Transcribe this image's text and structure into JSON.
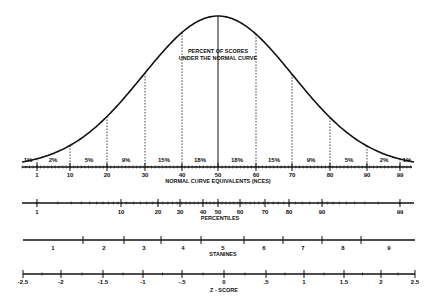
{
  "title_lines": [
    "PERCENT OF SCORES",
    "UNDER THE NORMAL CURVE"
  ],
  "colors": {
    "ink": "#111111",
    "background": "#ffffff"
  },
  "chart_data": {
    "type": "area",
    "title": "Percent of Scores Under the Normal Curve",
    "curve": "standard normal distribution",
    "segments": {
      "boundaries_nce": [
        1,
        10,
        20,
        30,
        40,
        50,
        60,
        70,
        80,
        90,
        99
      ],
      "percent_labels": [
        "1%",
        "2%",
        "5%",
        "9%",
        "15%",
        "18%",
        "18%",
        "15%",
        "9%",
        "5%",
        "2%",
        "1%"
      ]
    },
    "scales": [
      {
        "name": "Normal Curve Equivalents (NCEs)",
        "label": "NORMAL CURVE EQUIVALENTS (NCES)",
        "ticks": [
          "1",
          "10",
          "20",
          "30",
          "40",
          "50",
          "60",
          "70",
          "80",
          "90",
          "99"
        ]
      },
      {
        "name": "Percentiles",
        "label": "PERCENTILES",
        "ticks": [
          "1",
          "10",
          "20",
          "30",
          "40",
          "50",
          "60",
          "70",
          "80",
          "90",
          "99"
        ]
      },
      {
        "name": "Stanines",
        "label": "STANINES",
        "ticks": [
          "1",
          "2",
          "3",
          "4",
          "5",
          "6",
          "7",
          "8",
          "9"
        ]
      },
      {
        "name": "Z-Score",
        "label": "Z - SCORE",
        "ticks": [
          "-2.5",
          "-2",
          "-1.5",
          "-1",
          "-.5",
          "0",
          ".5",
          "1",
          "1.5",
          "2",
          "2.5"
        ]
      }
    ]
  },
  "nce": {
    "label": "NORMAL CURVE EQUIVALENTS (NCES)",
    "ticks": [
      {
        "t": "1",
        "x": 37
      },
      {
        "t": "10",
        "x": 70
      },
      {
        "t": "20",
        "x": 107
      },
      {
        "t": "30",
        "x": 145
      },
      {
        "t": "40",
        "x": 182
      },
      {
        "t": "50",
        "x": 218
      },
      {
        "t": "60",
        "x": 256
      },
      {
        "t": "70",
        "x": 292
      },
      {
        "t": "80",
        "x": 330
      },
      {
        "t": "90",
        "x": 367
      },
      {
        "t": "99",
        "x": 400
      }
    ]
  },
  "percent": [
    {
      "t": "1%",
      "x": 28
    },
    {
      "t": "2%",
      "x": 53
    },
    {
      "t": "5%",
      "x": 89
    },
    {
      "t": "9%",
      "x": 126
    },
    {
      "t": "15%",
      "x": 164
    },
    {
      "t": "18%",
      "x": 200
    },
    {
      "t": "18%",
      "x": 237
    },
    {
      "t": "15%",
      "x": 274
    },
    {
      "t": "9%",
      "x": 311
    },
    {
      "t": "5%",
      "x": 349
    },
    {
      "t": "2%",
      "x": 384
    },
    {
      "t": "1%",
      "x": 407
    }
  ],
  "percentiles": {
    "label": "PERCENTILES",
    "ticks": [
      {
        "t": "1",
        "x": 37
      },
      {
        "t": "10",
        "x": 121
      },
      {
        "t": "20",
        "x": 158
      },
      {
        "t": "30",
        "x": 180
      },
      {
        "t": "40",
        "x": 203
      },
      {
        "t": "50",
        "x": 218
      },
      {
        "t": "60",
        "x": 240
      },
      {
        "t": "70",
        "x": 265
      },
      {
        "t": "80",
        "x": 289
      },
      {
        "t": "90",
        "x": 322
      },
      {
        "t": "99",
        "x": 400
      }
    ]
  },
  "stanines": {
    "label": "STANINES",
    "ticks": [
      83,
      124,
      161,
      201,
      244,
      283,
      322,
      361
    ],
    "labels": [
      {
        "t": "1",
        "x": 53
      },
      {
        "t": "2",
        "x": 104
      },
      {
        "t": "3",
        "x": 144
      },
      {
        "t": "4",
        "x": 183
      },
      {
        "t": "5",
        "x": 223
      },
      {
        "t": "6",
        "x": 264
      },
      {
        "t": "7",
        "x": 303
      },
      {
        "t": "8",
        "x": 343
      },
      {
        "t": "9",
        "x": 389
      }
    ]
  },
  "zscore": {
    "label": "Z - SCORE",
    "ticks": [
      {
        "t": "-2.5",
        "x": 23
      },
      {
        "t": "-2",
        "x": 61
      },
      {
        "t": "-1.5",
        "x": 103
      },
      {
        "t": "-1",
        "x": 143
      },
      {
        "t": "-.5",
        "x": 182
      },
      {
        "t": "0",
        "x": 224
      },
      {
        "t": ".5",
        "x": 266
      },
      {
        "t": "1",
        "x": 304
      },
      {
        "t": "1.5",
        "x": 344
      },
      {
        "t": "2",
        "x": 381
      },
      {
        "t": "2.5",
        "x": 415
      }
    ]
  }
}
